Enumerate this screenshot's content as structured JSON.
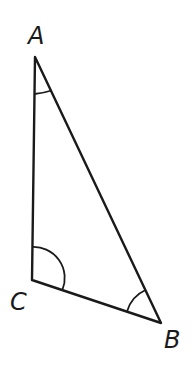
{
  "diagram": {
    "type": "triangle",
    "vertices": [
      {
        "name": "A",
        "label": "A",
        "x": 35,
        "y": 57
      },
      {
        "name": "B",
        "label": "B",
        "x": 161,
        "y": 323
      },
      {
        "name": "C",
        "label": "C",
        "x": 32,
        "y": 280
      }
    ],
    "edges": [
      "AB",
      "BC",
      "CA"
    ],
    "angle_marks": [
      {
        "vertex": "A",
        "arcs": 1
      },
      {
        "vertex": "B",
        "arcs": 1
      },
      {
        "vertex": "C",
        "arcs": 1
      }
    ],
    "stroke_color": "#1a1a1a",
    "background": "#ffffff"
  }
}
